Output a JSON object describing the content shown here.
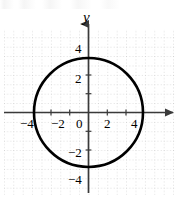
{
  "figure": {
    "title_fragment": "",
    "axis_names": {
      "y": "y",
      "x": ""
    },
    "origin_label": "0",
    "x_tick_labels": [
      "−4",
      "−2",
      "2",
      "4"
    ],
    "y_tick_labels": [
      "4",
      "2",
      "−2",
      "−4"
    ],
    "colors": {
      "curve": "#000000",
      "axis": "#3a3a3a",
      "grid": "#b9b9b9",
      "background": "#ffffff",
      "text": "#000000"
    }
  },
  "chart_data": {
    "type": "line",
    "title": "",
    "subtitle": "",
    "xlabel": "",
    "ylabel": "y",
    "xlim": [
      -9.5,
      9.5
    ],
    "ylim": [
      -9.0,
      11.0
    ],
    "grid": true,
    "grid_style": "dotted",
    "grid_spacing": 1,
    "legend": null,
    "x_ticks": [
      -4,
      -2,
      0,
      2,
      4
    ],
    "x_tick_labels": [
      "−4",
      "−2",
      "0",
      "2",
      "4"
    ],
    "y_ticks": [
      -4,
      -2,
      2,
      4
    ],
    "y_tick_labels": [
      "−4",
      "−2",
      "2",
      "4"
    ],
    "annotations": [],
    "series": [
      {
        "name": "circle",
        "type": "circle",
        "equation": "x^2 + y^2 = 25",
        "center": [
          0,
          0
        ],
        "radius": 5,
        "x_intercepts": [
          -5,
          5
        ],
        "y_intercepts": [
          -5,
          5
        ],
        "stroke_width": 2.6,
        "color": "#000000"
      }
    ]
  }
}
